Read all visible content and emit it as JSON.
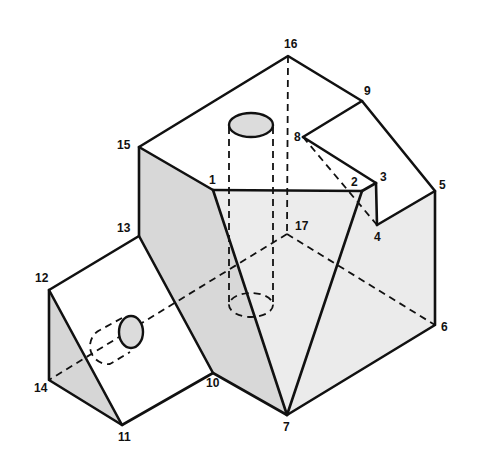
{
  "diagram": {
    "type": "isometric-solid-drawing",
    "colors": {
      "edge": "#111111",
      "face_light": "#ededed",
      "face_mid": "#dcdcdc",
      "face_dark": "#cfcfcf",
      "background": "#ffffff"
    },
    "vertices": [
      {
        "id": "1",
        "x": 213,
        "y": 190,
        "lx": -4,
        "ly": -6
      },
      {
        "id": "2",
        "x": 362,
        "y": 191,
        "lx": -11,
        "ly": -5
      },
      {
        "id": "3",
        "x": 376,
        "y": 183,
        "lx": 4,
        "ly": -2
      },
      {
        "id": "4",
        "x": 377,
        "y": 225,
        "lx": -3,
        "ly": 16
      },
      {
        "id": "5",
        "x": 435,
        "y": 191,
        "lx": 4,
        "ly": -2
      },
      {
        "id": "6",
        "x": 435,
        "y": 325,
        "lx": 6,
        "ly": 6
      },
      {
        "id": "7",
        "x": 287,
        "y": 415,
        "lx": -4,
        "ly": 16
      },
      {
        "id": "8",
        "x": 303,
        "y": 137,
        "lx": -9,
        "ly": 4
      },
      {
        "id": "9",
        "x": 362,
        "y": 101,
        "lx": 2,
        "ly": -6
      },
      {
        "id": "10",
        "x": 213,
        "y": 373,
        "lx": -7,
        "ly": 14
      },
      {
        "id": "11",
        "x": 122,
        "y": 425,
        "lx": -4,
        "ly": 16
      },
      {
        "id": "12",
        "x": 49,
        "y": 290,
        "lx": -14,
        "ly": -8
      },
      {
        "id": "13",
        "x": 139,
        "y": 236,
        "lx": -22,
        "ly": -4
      },
      {
        "id": "14",
        "x": 49,
        "y": 380,
        "lx": -15,
        "ly": 12
      },
      {
        "id": "15",
        "x": 139,
        "y": 147,
        "lx": -22,
        "ly": 2
      },
      {
        "id": "16",
        "x": 288,
        "y": 56,
        "lx": -4,
        "ly": -8
      },
      {
        "id": "17",
        "x": 287,
        "y": 234,
        "lx": 8,
        "ly": -4
      }
    ]
  }
}
